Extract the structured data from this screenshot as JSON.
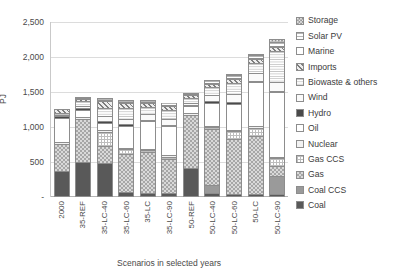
{
  "chart_data": {
    "type": "bar",
    "stacked": true,
    "title": "",
    "xlabel": "Scenarios in selected years",
    "ylabel": "PJ",
    "ylim": [
      0,
      2500
    ],
    "ytick_step": 500,
    "ytick_labels": [
      "2,500",
      "2,000",
      "1,500",
      "1,000",
      "500",
      "-"
    ],
    "ytick_values": [
      2500,
      2000,
      1500,
      1000,
      500,
      0
    ],
    "grid": true,
    "legend_position": "right",
    "categories": [
      "2000",
      "35-REF",
      "35-LC-40",
      "35-LC-60",
      "35-LC",
      "35-LC-90",
      "50-REF",
      "50-LC-40",
      "50-LC-60",
      "50-LC",
      "50-LC-90"
    ],
    "legend": [
      "Storage",
      "Solar PV",
      "Marine",
      "Imports",
      "Biowaste & others",
      "Wind",
      "Hydro",
      "Oil",
      "Nuclear",
      "Gas CCS",
      "Gas",
      "Coal CCS",
      "Coal"
    ],
    "stack_order_bottom_to_top": [
      "Coal",
      "Coal CCS",
      "Gas",
      "Gas CCS",
      "Nuclear",
      "Oil",
      "Hydro",
      "Wind",
      "Biowaste & others",
      "Imports",
      "Marine",
      "Solar PV",
      "Storage"
    ],
    "series": [
      {
        "name": "Coal",
        "key": "coal",
        "fill": "f-coal",
        "values": [
          350,
          480,
          470,
          40,
          30,
          25,
          400,
          30,
          20,
          15,
          10
        ]
      },
      {
        "name": "Coal CCS",
        "key": "coalccs",
        "fill": "f-coalccs",
        "values": [
          0,
          0,
          0,
          0,
          0,
          0,
          0,
          120,
          0,
          0,
          270
        ]
      },
      {
        "name": "Gas",
        "key": "gas",
        "fill": "f-gas",
        "values": [
          400,
          640,
          250,
          560,
          600,
          510,
          770,
          810,
          800,
          850,
          140
        ]
      },
      {
        "name": "Gas CCS",
        "key": "gasccs",
        "fill": "f-gasccs",
        "values": [
          0,
          0,
          210,
          70,
          25,
          25,
          0,
          25,
          110,
          110,
          110
        ]
      },
      {
        "name": "Nuclear",
        "key": "nuclear",
        "fill": "f-nuclear",
        "values": [
          30,
          25,
          25,
          25,
          25,
          25,
          25,
          25,
          25,
          25,
          25
        ]
      },
      {
        "name": "Oil",
        "key": "oil",
        "fill": "f-oil",
        "values": [
          350,
          100,
          100,
          320,
          400,
          420,
          100,
          330,
          380,
          640,
          930
        ]
      },
      {
        "name": "Hydro",
        "key": "hydro",
        "fill": "f-hydro",
        "values": [
          25,
          25,
          25,
          25,
          25,
          25,
          25,
          25,
          25,
          25,
          25
        ]
      },
      {
        "name": "Wind",
        "key": "wind",
        "fill": "f-wind",
        "values": [
          20,
          30,
          70,
          80,
          80,
          90,
          30,
          90,
          110,
          110,
          130
        ]
      },
      {
        "name": "Biowaste & others",
        "key": "biowaste",
        "fill": "f-biowaste",
        "values": [
          25,
          70,
          130,
          150,
          110,
          130,
          70,
          120,
          160,
          150,
          440
        ]
      },
      {
        "name": "Imports",
        "key": "imports",
        "fill": "f-imports",
        "values": [
          55,
          30,
          90,
          80,
          45,
          50,
          40,
          50,
          60,
          50,
          60
        ]
      },
      {
        "name": "Marine",
        "key": "marine",
        "fill": "f-marine",
        "values": [
          0,
          10,
          10,
          10,
          10,
          10,
          10,
          10,
          10,
          10,
          15
        ]
      },
      {
        "name": "Solar PV",
        "key": "solarpv",
        "fill": "f-solarpv",
        "values": [
          0,
          20,
          30,
          30,
          30,
          40,
          20,
          40,
          50,
          50,
          60
        ]
      },
      {
        "name": "Storage",
        "key": "storage",
        "fill": "f-storage",
        "values": [
          0,
          0,
          0,
          0,
          0,
          0,
          0,
          0,
          10,
          10,
          45
        ]
      }
    ],
    "totals": [
      1255,
      1430,
      1410,
      1390,
      1380,
      1350,
      1490,
      1675,
      1760,
      2045,
      2260
    ]
  }
}
